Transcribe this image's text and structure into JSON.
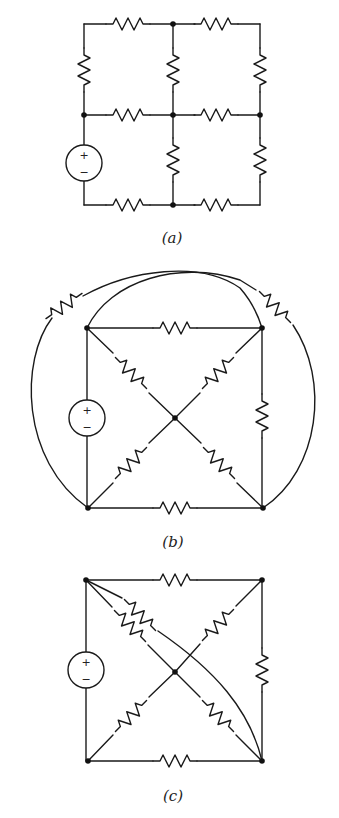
{
  "figure": {
    "panels": [
      {
        "id": "a",
        "caption": "(a)",
        "description": "2x2 grid resistor network with voltage source on left lower branch",
        "resistor_count": 11,
        "source_count": 1
      },
      {
        "id": "b",
        "caption": "(b)",
        "description": "Square with diagonals to center node, two outer arcs each containing a resistor",
        "resistor_count": 9,
        "source_count": 1
      },
      {
        "id": "c",
        "caption": "(c)",
        "description": "Square with diagonals to center node, inner curved wire and extra diagonal resistor",
        "resistor_count": 8,
        "source_count": 1
      }
    ],
    "source": {
      "plus": "+",
      "minus": "−"
    },
    "colors": {
      "wire": "#1a1a1a",
      "background": "#ffffff"
    }
  }
}
